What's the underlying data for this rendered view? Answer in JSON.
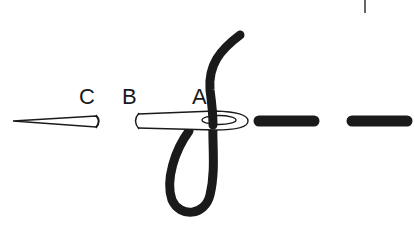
{
  "diagram": {
    "type": "sewing-stitch-illustration",
    "labels": {
      "a": "A",
      "b": "B",
      "c": "C"
    },
    "colors": {
      "thread": "#1a1a1a",
      "needle_outline": "#1a1a1a",
      "background": "#ffffff"
    },
    "elements": [
      "needle tip (C)",
      "needle shaft (B)",
      "needle eye (A) with thread looped through",
      "completed stitches (2 dashes)"
    ]
  }
}
